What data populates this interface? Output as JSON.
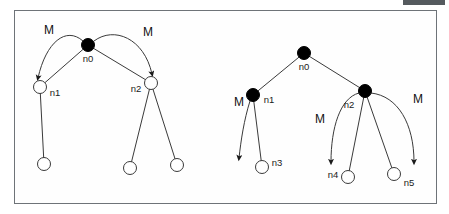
{
  "figure": {
    "title": "",
    "background_color": "#ffffff",
    "frame_color": "#6e7378",
    "top_bar_color": "#555a5e",
    "stroke_color": "#3a3a3a",
    "filled_node_color": "#000000",
    "open_node_color": "#ffffff"
  },
  "labels": {
    "m": "M",
    "n0": "n0",
    "n1": "n1",
    "n2": "n2",
    "n3": "n3",
    "n4": "n4",
    "n5": "n5"
  },
  "left_diagram": {
    "name": "left-tree",
    "nodes": [
      {
        "id": "n0",
        "label": "n0",
        "type": "filled",
        "cx": 88,
        "cy": 45,
        "r": 6.5,
        "label_x": 88,
        "label_y": 62
      },
      {
        "id": "n1",
        "label": "n1",
        "type": "open",
        "cx": 40,
        "cy": 87,
        "r": 6.5,
        "label_x": 55,
        "label_y": 96
      },
      {
        "id": "n2",
        "label": "n2",
        "type": "open",
        "cx": 151,
        "cy": 83,
        "r": 6.5,
        "label_x": 136,
        "label_y": 92
      },
      {
        "id": "l1",
        "label": "",
        "type": "open",
        "cx": 44,
        "cy": 164,
        "r": 6.5,
        "label_x": 0,
        "label_y": 0
      },
      {
        "id": "l2",
        "label": "",
        "type": "open",
        "cx": 130,
        "cy": 168,
        "r": 6.5,
        "label_x": 0,
        "label_y": 0
      },
      {
        "id": "l3",
        "label": "",
        "type": "open",
        "cx": 177,
        "cy": 165,
        "r": 6.5,
        "label_x": 0,
        "label_y": 0
      }
    ],
    "tree_edges": [
      {
        "from": "n0",
        "to": "n1"
      },
      {
        "from": "n0",
        "to": "n2"
      },
      {
        "from": "n1",
        "to": "l1"
      },
      {
        "from": "n2",
        "to": "l2"
      },
      {
        "from": "n2",
        "to": "l3"
      }
    ],
    "m_arrows": [
      {
        "label": "M",
        "label_x": 49,
        "label_y": 34,
        "path": "M 83 41 C 66 26 46 42 38 78"
      },
      {
        "label": "M",
        "label_x": 148,
        "label_y": 36,
        "path": "M 94 41 C 114 26 144 38 152 74"
      }
    ]
  },
  "right_diagram": {
    "name": "right-tree",
    "nodes": [
      {
        "id": "n0",
        "label": "n0",
        "type": "filled",
        "cx": 304,
        "cy": 53,
        "r": 6.5,
        "label_x": 304,
        "label_y": 70
      },
      {
        "id": "n1",
        "label": "n1",
        "type": "filled",
        "cx": 253,
        "cy": 95,
        "r": 6.5,
        "label_x": 269,
        "label_y": 103
      },
      {
        "id": "n2",
        "label": "n2",
        "type": "filled",
        "cx": 365,
        "cy": 91,
        "r": 6.5,
        "label_x": 349,
        "label_y": 108
      },
      {
        "id": "n3",
        "label": "n3",
        "type": "open",
        "cx": 262,
        "cy": 167,
        "r": 6.5,
        "label_x": 277,
        "label_y": 166
      },
      {
        "id": "n4",
        "label": "n4",
        "type": "open",
        "cx": 348,
        "cy": 177,
        "r": 6.5,
        "label_x": 333,
        "label_y": 178
      },
      {
        "id": "n5",
        "label": "n5",
        "type": "open",
        "cx": 394,
        "cy": 174,
        "r": 6.5,
        "label_x": 409,
        "label_y": 186
      }
    ],
    "tree_edges": [
      {
        "from": "n0",
        "to": "n1"
      },
      {
        "from": "n0",
        "to": "n2"
      },
      {
        "from": "n1",
        "to": "n3"
      },
      {
        "from": "n2",
        "to": "n4"
      },
      {
        "from": "n2",
        "to": "n5"
      }
    ],
    "m_arrows": [
      {
        "label": "M",
        "label_x": 239,
        "label_y": 106,
        "path": "M 250 101 C 244 120 241 140 239 158"
      },
      {
        "label": "M",
        "label_x": 320,
        "label_y": 123,
        "path": "M 359 93 C 340 98 331 128 331 162"
      },
      {
        "label": "M",
        "label_x": 418,
        "label_y": 103,
        "path": "M 371 93 C 398 96 414 124 414 162"
      }
    ]
  }
}
